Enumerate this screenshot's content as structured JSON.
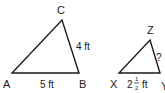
{
  "diagram": {
    "triangle_abc": {
      "vertices": {
        "A": "A",
        "B": "B",
        "C": "C"
      },
      "sides": {
        "BC": "4 ft",
        "AB": "5 ft"
      }
    },
    "triangle_xyz": {
      "vertices": {
        "X": "X",
        "Y": "Y",
        "Z": "Z"
      },
      "sides": {
        "YZ": "?",
        "XY_whole": "2",
        "XY_num": "1",
        "XY_den": "2",
        "XY_unit": "ft"
      }
    },
    "colors": {
      "stroke": "#1a1a1a",
      "background": "#ffffff"
    }
  }
}
